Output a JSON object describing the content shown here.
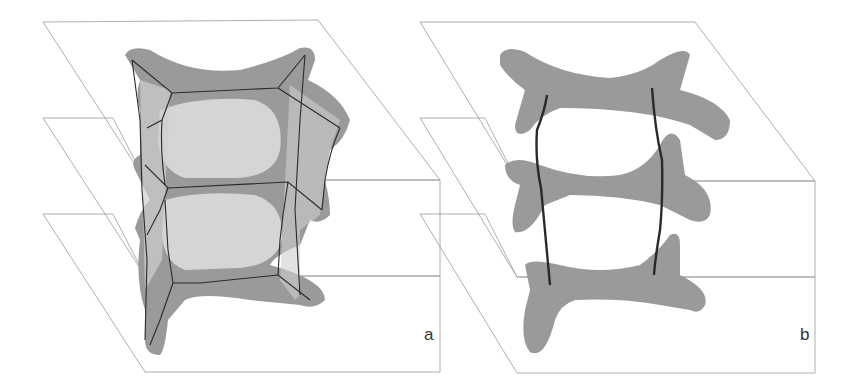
{
  "figure": {
    "panels": [
      {
        "id": "a",
        "label": "a"
      },
      {
        "id": "b",
        "label": "b"
      }
    ]
  },
  "colors": {
    "plane_line": "#9a9a9a",
    "shape_dark": "#9a9a9a",
    "shape_light": "#dcdcdc",
    "edge": "#2a2a2a"
  }
}
